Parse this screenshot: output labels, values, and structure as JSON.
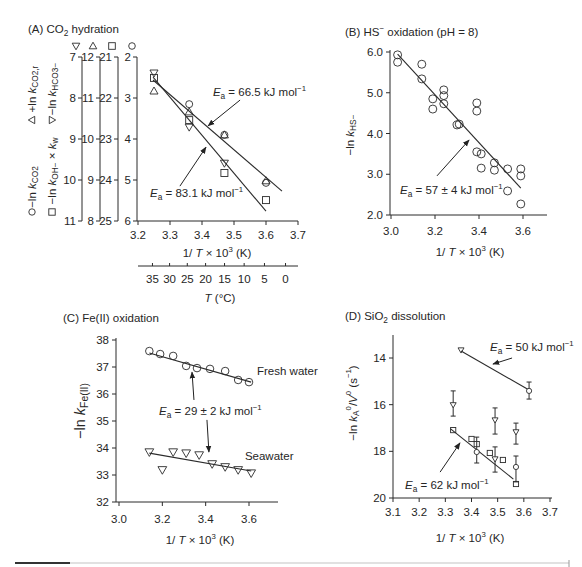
{
  "figure": {
    "panel_order": [
      "A",
      "B",
      "C",
      "D"
    ]
  },
  "chart_data": [
    {
      "panel": "A",
      "type": "scatter",
      "title": [
        {
          "t": "(A) CO"
        },
        {
          "t": "2",
          "sub": true
        },
        {
          "t": " hydration"
        }
      ],
      "xlabel": [
        {
          "t": "1/ "
        },
        {
          "t": "T",
          "it": true
        },
        {
          "t": " × 10"
        },
        {
          "t": "3",
          "sup": true
        },
        {
          "t": " (K)"
        }
      ],
      "xlim": [
        3.2,
        3.7
      ],
      "xticks": [
        "3.2",
        "3.3",
        "3.4",
        "3.5",
        "3.6",
        "3.7"
      ],
      "grid": false,
      "secondary_xaxis": {
        "label": [
          {
            "t": "T",
            "it": true
          },
          {
            "t": " (°C)"
          }
        ],
        "ticks": [
          "35",
          "30",
          "25",
          "20",
          "15",
          "10",
          "5",
          "0"
        ]
      },
      "y_axes": [
        {
          "marker": "triangle-down",
          "ticks": [
            "7",
            "8",
            "9",
            "10",
            "11"
          ]
        },
        {
          "marker": "triangle-up",
          "ticks": [
            "12",
            "11",
            "10",
            "9",
            "8"
          ]
        },
        {
          "marker": "square",
          "ticks": [
            "21",
            "22",
            "23",
            "24",
            "25"
          ]
        },
        {
          "marker": "circle",
          "ticks": [
            "2",
            "3",
            "4",
            "5",
            "6"
          ]
        }
      ],
      "ylabels": [
        {
          "marker": "triangle-up",
          "text": [
            {
              "t": "+ln "
            },
            {
              "t": "k",
              "it": true
            },
            {
              "t": "CO2,r",
              "sub": true
            }
          ]
        },
        {
          "marker": "circle",
          "text": [
            {
              "t": "−ln "
            },
            {
              "t": "k",
              "it": true
            },
            {
              "t": "CO2",
              "sub": true
            }
          ]
        },
        {
          "marker": "triangle-down",
          "text": [
            {
              "t": "−ln "
            },
            {
              "t": "k",
              "it": true
            },
            {
              "t": "HCO3−",
              "sub": true
            }
          ]
        },
        {
          "marker": "square",
          "text": [
            {
              "t": "−ln "
            },
            {
              "t": "k",
              "it": true
            },
            {
              "t": "OH−",
              "sub": true
            },
            {
              "t": " × "
            },
            {
              "t": "k",
              "it": true
            },
            {
              "t": "w",
              "sub": true
            }
          ]
        }
      ],
      "series": [
        {
          "name": "−ln k_CO2",
          "marker": "circle",
          "axis": 3,
          "points": [
            [
              3.36,
              3.15
            ],
            [
              3.47,
              3.9
            ],
            [
              3.6,
              5.07
            ]
          ]
        },
        {
          "name": "+ln k_CO2,r",
          "marker": "triangle-up",
          "axis": 1,
          "points": [
            [
              3.25,
              11.17
            ],
            [
              3.36,
              10.66
            ],
            [
              3.47,
              10.1
            ],
            [
              3.6,
              8.98
            ]
          ]
        },
        {
          "name": "−ln k_HCO3−",
          "marker": "triangle-down",
          "axis": 0,
          "points": [
            [
              3.25,
              7.39
            ],
            [
              3.36,
              8.71
            ],
            [
              3.47,
              9.59
            ]
          ]
        },
        {
          "name": "−ln k_OH− × k_w",
          "marker": "square",
          "axis": 2,
          "points": [
            [
              3.25,
              21.51
            ],
            [
              3.36,
              22.54
            ],
            [
              3.47,
              23.83
            ],
            [
              3.6,
              24.49
            ]
          ]
        }
      ],
      "fits": [
        {
          "name": "Ea = 66.5 kJ mol−1",
          "axis": 3,
          "from": [
            3.247,
            2.56
          ],
          "to": [
            3.65,
            5.27
          ]
        },
        {
          "name": "Ea = 83.1 kJ mol−1",
          "axis": 3,
          "from": [
            3.247,
            2.49
          ],
          "to": [
            3.6,
            5.76
          ]
        }
      ],
      "annotations": [
        {
          "axis": 3,
          "text": [
            {
              "t": "E",
              "it": true
            },
            {
              "t": "a",
              "sub": true
            },
            {
              "t": " = 66.5 kJ mol"
            },
            {
              "t": "−1",
              "sup": true
            }
          ],
          "at": [
            3.434,
            2.95
          ],
          "arrows": [
            {
              "from": [
                3.519,
                3.05
              ],
              "to": [
                3.419,
                3.68
              ]
            }
          ]
        },
        {
          "axis": 3,
          "text": [
            {
              "t": "E",
              "it": true
            },
            {
              "t": "a",
              "sub": true
            },
            {
              "t": " = 83.1 kJ mol"
            },
            {
              "t": "−1",
              "sup": true
            }
          ],
          "at": [
            3.2375,
            5.41
          ],
          "arrows": [
            {
              "from": [
                3.331,
                5.15
              ],
              "to": [
                3.4125,
                4.2
              ]
            }
          ]
        }
      ]
    },
    {
      "panel": "B",
      "type": "scatter",
      "title": [
        {
          "t": "(B) HS"
        },
        {
          "t": "−",
          "sup": true
        },
        {
          "t": " oxidation (pH = 8)"
        }
      ],
      "xlabel": [
        {
          "t": "1/ "
        },
        {
          "t": "T",
          "it": true
        },
        {
          "t": " × 10"
        },
        {
          "t": "3",
          "sup": true
        },
        {
          "t": " (K)"
        }
      ],
      "ylabel": [
        {
          "t": "−ln "
        },
        {
          "t": "k",
          "it": true
        },
        {
          "t": "HS−",
          "sub": true
        }
      ],
      "xlim": [
        3.0,
        3.7
      ],
      "ylim": [
        2.0,
        6.0
      ],
      "xticks": [
        "3.0",
        "3.2",
        "3.4",
        "3.6"
      ],
      "yticks": [
        "2.0",
        "3.0",
        "4.0",
        "5.0",
        "6.0"
      ],
      "grid": false,
      "series": [
        {
          "name": "−ln k_HS−",
          "marker": "circle",
          "points": [
            [
              3.03,
              5.93
            ],
            [
              3.03,
              5.75
            ],
            [
              3.14,
              5.7
            ],
            [
              3.14,
              5.34
            ],
            [
              3.19,
              4.85
            ],
            [
              3.19,
              4.6
            ],
            [
              3.24,
              5.07
            ],
            [
              3.24,
              4.93
            ],
            [
              3.24,
              4.73
            ],
            [
              3.3,
              4.21
            ],
            [
              3.31,
              4.23
            ],
            [
              3.39,
              4.75
            ],
            [
              3.39,
              4.55
            ],
            [
              3.39,
              3.55
            ],
            [
              3.41,
              3.5
            ],
            [
              3.41,
              3.15
            ],
            [
              3.47,
              3.28
            ],
            [
              3.47,
              3.1
            ],
            [
              3.53,
              3.13
            ],
            [
              3.53,
              2.59
            ],
            [
              3.59,
              3.13
            ],
            [
              3.59,
              2.96
            ],
            [
              3.59,
              2.27
            ]
          ]
        }
      ],
      "fits": [
        {
          "name": "Ea = 57 ± 4 kJ mol−1",
          "from": [
            3.03,
            5.95
          ],
          "to": [
            3.59,
            2.66
          ]
        }
      ],
      "annotations": [
        {
          "text": [
            {
              "t": "E",
              "it": true
            },
            {
              "t": "a",
              "sub": true
            },
            {
              "t": " = 57 ± 4 kJ mol"
            },
            {
              "t": "−1",
              "sup": true
            }
          ],
          "at": [
            3.041,
            2.52
          ],
          "arrows": [
            {
              "from": [
                3.209,
                2.96
              ],
              "to": [
                3.355,
                3.84
              ]
            }
          ]
        }
      ]
    },
    {
      "panel": "C",
      "type": "scatter",
      "title": [
        {
          "t": "(C) Fe(II) oxidation"
        }
      ],
      "xlabel": [
        {
          "t": "1/ "
        },
        {
          "t": "T",
          "it": true
        },
        {
          "t": " × 10"
        },
        {
          "t": "3",
          "sup": true
        },
        {
          "t": " (K)"
        }
      ],
      "ylabel": [
        {
          "t": "−ln "
        },
        {
          "t": "k",
          "it": true
        },
        {
          "t": "Fe(II)",
          "sub": true
        }
      ],
      "xlim": [
        3.0,
        3.73
      ],
      "ylim": [
        32,
        38
      ],
      "xticks": [
        "3.0",
        "3.2",
        "3.4",
        "3.6"
      ],
      "yticks": [
        "32",
        "33",
        "34",
        "35",
        "36",
        "37",
        "38"
      ],
      "grid": false,
      "series": [
        {
          "name": "Fresh water",
          "marker": "circle",
          "points": [
            [
              3.14,
              37.59
            ],
            [
              3.19,
              37.48
            ],
            [
              3.25,
              37.41
            ],
            [
              3.31,
              37.04
            ],
            [
              3.36,
              36.96
            ],
            [
              3.42,
              36.93
            ],
            [
              3.49,
              36.85
            ],
            [
              3.55,
              36.52
            ],
            [
              3.6,
              36.44
            ]
          ]
        },
        {
          "name": "Seawater",
          "marker": "triangle-down",
          "points": [
            [
              3.14,
              33.85
            ],
            [
              3.2,
              33.19
            ],
            [
              3.25,
              33.85
            ],
            [
              3.31,
              33.81
            ],
            [
              3.37,
              33.74
            ],
            [
              3.43,
              33.41
            ],
            [
              3.49,
              33.3
            ],
            [
              3.55,
              33.19
            ],
            [
              3.61,
              33.07
            ]
          ]
        }
      ],
      "fits": [
        {
          "name": "Fresh water fit",
          "from": [
            3.14,
            37.52
          ],
          "to": [
            3.61,
            36.44
          ]
        },
        {
          "name": "Seawater fit",
          "from": [
            3.14,
            33.81
          ],
          "to": [
            3.61,
            33.15
          ]
        }
      ],
      "labels": [
        {
          "text": "Fresh water",
          "at": [
            3.637,
            36.7
          ]
        },
        {
          "text": "Seawater",
          "at": [
            3.581,
            33.56
          ]
        }
      ],
      "annotations": [
        {
          "text": [
            {
              "t": "E",
              "it": true
            },
            {
              "t": "a",
              "sub": true
            },
            {
              "t": " = 29 ± 2 kJ mol"
            },
            {
              "t": "−1",
              "sup": true
            }
          ],
          "at": [
            3.185,
            35.22
          ],
          "arrows": [
            {
              "from": [
                3.346,
                35.78
              ],
              "to": [
                3.337,
                36.81
              ]
            },
            {
              "from": [
                3.406,
                35.04
              ],
              "to": [
                3.415,
                33.85
              ]
            }
          ]
        }
      ]
    },
    {
      "panel": "D",
      "type": "scatter",
      "title": [
        {
          "t": "(D) SiO"
        },
        {
          "t": "2",
          "sub": true
        },
        {
          "t": " dissolution"
        }
      ],
      "xlabel": [
        {
          "t": "1/ "
        },
        {
          "t": "T",
          "it": true
        },
        {
          "t": " × 10"
        },
        {
          "t": "3",
          "sup": true
        },
        {
          "t": " (K)"
        }
      ],
      "ylabel": [
        {
          "t": "−ln "
        },
        {
          "t": "k",
          "it": true
        },
        {
          "t": "A",
          "sub": true
        },
        {
          "t": "0",
          "sup": true
        },
        {
          "t": "/"
        },
        {
          "t": "V",
          "it": true
        },
        {
          "t": "0",
          "sup": true
        },
        {
          "t": " (s"
        },
        {
          "t": "−1",
          "sup": true
        },
        {
          "t": ")"
        }
      ],
      "xlim": [
        3.1,
        3.7
      ],
      "ylim": [
        13,
        20
      ],
      "y_inverted": true,
      "xticks": [
        "3.1",
        "3.2",
        "3.3",
        "3.4",
        "3.5",
        "3.6",
        "3.7"
      ],
      "yticks": [
        "14",
        "16",
        "18",
        "20"
      ],
      "grid": false,
      "series": [
        {
          "name": "triangles",
          "marker": "triangle-down",
          "points": [
            [
              3.36,
              13.66,
              null
            ],
            [
              3.33,
              16.01,
              [
                15.41,
                16.49
              ]
            ],
            [
              3.49,
              16.66,
              [
                16.14,
                17.26
              ]
            ],
            [
              3.57,
              17.17,
              [
                16.79,
                17.69
              ]
            ],
            [
              3.49,
              18.33,
              [
                17.81,
                18.89
              ]
            ]
          ]
        },
        {
          "name": "circles",
          "marker": "circle",
          "points": [
            [
              3.62,
              15.41,
              [
                15.03,
                15.76
              ]
            ],
            [
              3.42,
              18.03,
              [
                17.39,
                18.5
              ]
            ],
            [
              3.57,
              18.67,
              [
                18.2,
                19.31
              ]
            ]
          ]
        },
        {
          "name": "squares",
          "marker": "square",
          "points": [
            [
              3.33,
              17.09,
              null
            ],
            [
              3.4,
              17.47,
              null
            ],
            [
              3.42,
              17.69,
              null
            ],
            [
              3.47,
              18.07,
              null
            ],
            [
              3.52,
              18.37,
              null
            ],
            [
              3.57,
              19.4,
              null
            ]
          ]
        }
      ],
      "fits": [
        {
          "name": "Ea = 50 kJ mol−1",
          "from": [
            3.36,
            13.7
          ],
          "to": [
            3.62,
            15.37
          ]
        },
        {
          "name": "Ea = 62 kJ mol−1",
          "from": [
            3.32,
            17.04
          ],
          "to": [
            3.56,
            19.19
          ]
        }
      ],
      "annotations": [
        {
          "text": [
            {
              "t": "E",
              "it": true
            },
            {
              "t": "a",
              "sub": true
            },
            {
              "t": " = 50 kJ mol"
            },
            {
              "t": "−1",
              "sup": true
            }
          ],
          "at": [
            3.471,
            13.7
          ],
          "arrows": [
            {
              "from": [
                3.555,
                14.0
              ],
              "to": [
                3.482,
                14.26
              ]
            }
          ]
        },
        {
          "text": [
            {
              "t": "E",
              "it": true
            },
            {
              "t": "a",
              "sub": true
            },
            {
              "t": " = 62 kJ mol"
            },
            {
              "t": "−1",
              "sup": true
            }
          ],
          "at": [
            3.146,
            19.63
          ],
          "arrows": [
            {
              "from": [
                3.28,
                18.89
              ],
              "to": [
                3.356,
                17.64
              ]
            }
          ]
        }
      ]
    }
  ]
}
